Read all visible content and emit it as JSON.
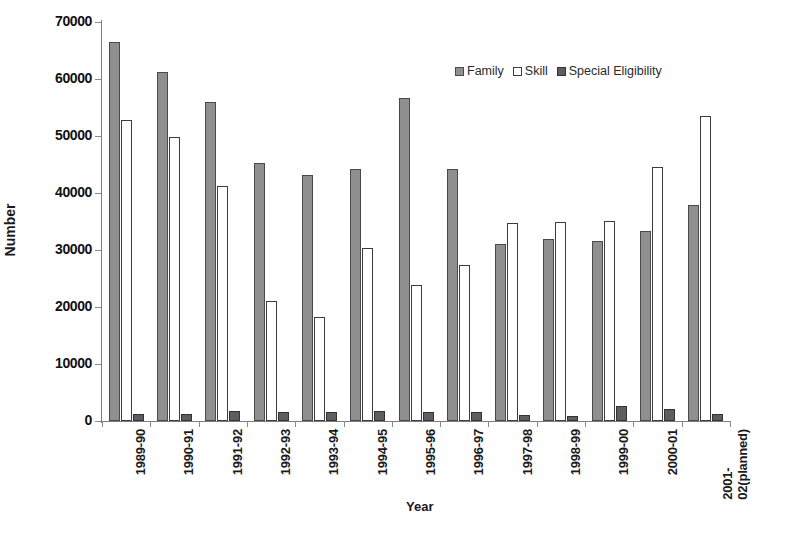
{
  "chart_data": {
    "type": "bar",
    "title": "",
    "xlabel": "Year",
    "ylabel": "Number",
    "ylim": [
      0,
      70000
    ],
    "ytick_values": [
      0,
      10000,
      20000,
      30000,
      40000,
      50000,
      60000,
      70000
    ],
    "ytick_labels": [
      "0",
      "10000",
      "20000",
      "30000",
      "40000",
      "50000",
      "60000",
      "70000"
    ],
    "grid": false,
    "legend_position": "top-right",
    "categories": [
      "1989-90",
      "1990-91",
      "1991-92",
      "1992-93",
      "1993-94",
      "1994-95",
      "1995-96",
      "1996-97",
      "1997-98",
      "1998-99",
      "1999-00",
      "2000-01",
      "2001-02(planned)"
    ],
    "category_lines": [
      [
        "1989-90"
      ],
      [
        "1990-91"
      ],
      [
        "1991-92"
      ],
      [
        "1992-93"
      ],
      [
        "1993-94"
      ],
      [
        "1994-95"
      ],
      [
        "1995-96"
      ],
      [
        "1996-97"
      ],
      [
        "1997-98"
      ],
      [
        "1998-99"
      ],
      [
        "1999-00"
      ],
      [
        "2000-01"
      ],
      [
        "2001-",
        "02(planned)"
      ]
    ],
    "series": [
      {
        "name": "Family",
        "color": "#8f8f8f",
        "values": [
          66500,
          61300,
          56000,
          45200,
          43100,
          44200,
          56600,
          44200,
          31100,
          31900,
          31600,
          33400,
          37900
        ]
      },
      {
        "name": "Skill",
        "color": "#ffffff",
        "values": [
          52800,
          49800,
          41300,
          21000,
          18300,
          30400,
          23800,
          27300,
          34700,
          34900,
          35100,
          44500,
          53500
        ]
      },
      {
        "name": "Special Eligibility",
        "color": "#5e5e5e",
        "values": [
          1300,
          1300,
          1700,
          1600,
          1500,
          1700,
          1600,
          1600,
          1100,
          900,
          2600,
          2100,
          1300
        ]
      }
    ]
  },
  "legend": {
    "items": [
      {
        "label": "Family",
        "swatch": "family"
      },
      {
        "label": "Skill",
        "swatch": "skill"
      },
      {
        "label": "Special Eligibility",
        "swatch": "special"
      }
    ]
  }
}
